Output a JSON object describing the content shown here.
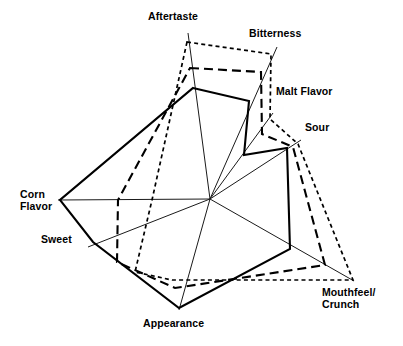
{
  "figure": {
    "background_color": "#ffffff",
    "ink_color": "#000000"
  },
  "chart_data": {
    "type": "radar",
    "title": "",
    "subtitle": "",
    "xlabel": "",
    "ylabel": "",
    "grid": false,
    "legend_position": "none",
    "center": {
      "x": 210,
      "y": 199
    },
    "scale": {
      "min": 0,
      "max": 1,
      "note": "values are fractions of each axis length from center to axis tip"
    },
    "categories": [
      "Aftertaste",
      "Bitterness",
      "Malt Flavor",
      "Sour",
      "Mouthfeel/Crunch",
      "Appearance",
      "Sweet",
      "Corn Flavor"
    ],
    "axes": [
      {
        "label": "Aftertaste",
        "label_lines": [
          "Aftertaste"
        ],
        "tip": {
          "x": 188,
          "y": 33
        },
        "label_anchor": "bottom"
      },
      {
        "label": "Bitterness",
        "label_lines": [
          "Bitterness"
        ],
        "tip": {
          "x": 277,
          "y": 47
        },
        "label_anchor": "bottom-left"
      },
      {
        "label": "Malt Flavor",
        "label_lines": [
          "Malt Flavor"
        ],
        "tip": {
          "x": 273,
          "y": 113
        },
        "label_anchor": "left"
      },
      {
        "label": "Sour",
        "label_lines": [
          "Sour"
        ],
        "tip": {
          "x": 301,
          "y": 140
        },
        "label_anchor": "left"
      },
      {
        "label": "Mouthfeel/Crunch",
        "label_lines": [
          "Mouthfeel/",
          "Crunch"
        ],
        "tip": {
          "x": 354,
          "y": 281
        },
        "label_anchor": "top-left"
      },
      {
        "label": "Appearance",
        "label_lines": [
          "Appearance"
        ],
        "tip": {
          "x": 179,
          "y": 310
        },
        "label_anchor": "top"
      },
      {
        "label": "Sweet",
        "label_lines": [
          "Sweet"
        ],
        "tip": {
          "x": 88,
          "y": 247
        },
        "label_anchor": "right"
      },
      {
        "label": "Corn Flavor",
        "label_lines": [
          "Corn",
          "Flavor"
        ],
        "tip": {
          "x": 58,
          "y": 200
        },
        "label_anchor": "right"
      }
    ],
    "series": [
      {
        "name": "Sample A",
        "line_style": "solid",
        "values": [
          0.68,
          0.41,
          0.53,
          0.85,
          0.57,
          0.98,
          0.96,
          0.96
        ],
        "points": [
          {
            "axis": "Aftertaste",
            "x": 193,
            "y": 88
          },
          {
            "axis": "Bitterness",
            "x": 249,
            "y": 101
          },
          {
            "axis": "Malt Flavor",
            "x": 244,
            "y": 155
          },
          {
            "axis": "Sour",
            "x": 287,
            "y": 148
          },
          {
            "axis": "Mouthfeel/Crunch",
            "x": 290,
            "y": 249
          },
          {
            "axis": "Appearance",
            "x": 179,
            "y": 308
          },
          {
            "axis": "Sweet",
            "x": 93,
            "y": 242
          },
          {
            "axis": "Corn Flavor",
            "x": 60,
            "y": 200
          }
        ]
      },
      {
        "name": "Sample B",
        "line_style": "long-dash",
        "values": [
          0.81,
          0.75,
          0.77,
          0.9,
          0.77,
          0.85,
          0.76,
          0.5
        ],
        "points": [
          {
            "axis": "Aftertaste",
            "x": 190,
            "y": 68
          },
          {
            "axis": "Bitterness",
            "x": 261,
            "y": 72
          },
          {
            "axis": "Malt Flavor",
            "x": 262,
            "y": 134
          },
          {
            "axis": "Sour",
            "x": 293,
            "y": 147
          },
          {
            "axis": "Mouthfeel/Crunch",
            "x": 325,
            "y": 265
          },
          {
            "axis": "Appearance",
            "x": 175,
            "y": 288
          },
          {
            "axis": "Sweet",
            "x": 117,
            "y": 262
          },
          {
            "axis": "Corn Flavor",
            "x": 118,
            "y": 200
          }
        ]
      },
      {
        "name": "Sample C",
        "line_style": "short-dash",
        "values": [
          0.95,
          0.93,
          0.95,
          0.96,
          1.0,
          0.74,
          0.62,
          0.38
        ],
        "points": [
          {
            "axis": "Aftertaste",
            "x": 187,
            "y": 42
          },
          {
            "axis": "Bitterness",
            "x": 271,
            "y": 54
          },
          {
            "axis": "Malt Flavor",
            "x": 270,
            "y": 119
          },
          {
            "axis": "Sour",
            "x": 298,
            "y": 144
          },
          {
            "axis": "Mouthfeel/Crunch",
            "x": 353,
            "y": 280
          },
          {
            "axis": "Appearance",
            "x": 172,
            "y": 280
          },
          {
            "axis": "Sweet",
            "x": 135,
            "y": 272
          },
          {
            "axis": "Corn Flavor",
            "x": 152,
            "y": 200
          }
        ]
      }
    ]
  }
}
